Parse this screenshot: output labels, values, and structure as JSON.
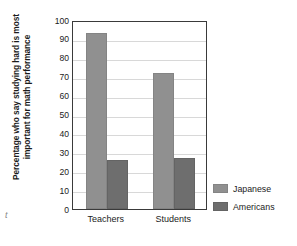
{
  "chart_data": {
    "type": "bar",
    "title": "",
    "xlabel": "",
    "ylabel": "Percentage who say studying hard is most important for math performance",
    "categories": [
      "Teachers",
      "Students"
    ],
    "series": [
      {
        "name": "Japanese",
        "values": [
          93,
          72
        ],
        "color": "#909090"
      },
      {
        "name": "Americans",
        "values": [
          26,
          27
        ],
        "color": "#6e6e6e"
      }
    ],
    "ylim": [
      0,
      100
    ],
    "yticks": [
      0,
      10,
      20,
      30,
      40,
      50,
      60,
      70,
      80,
      90,
      100
    ],
    "ytick_labels": [
      "0",
      "10",
      "20",
      "30",
      "40",
      "50",
      "60",
      "70",
      "80",
      "90",
      "100"
    ],
    "grid": true,
    "grid_axis": "y",
    "legend_position": "right",
    "bar_group_gap": true,
    "stray_mark": "t"
  }
}
